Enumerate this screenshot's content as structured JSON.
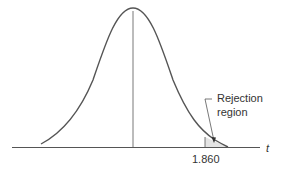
{
  "diagram": {
    "type": "t-distribution density curve",
    "axis_label": "t",
    "critical_value_label": "1.860",
    "annotation": {
      "line1": "Rejection",
      "line2": "region"
    },
    "colors": {
      "curve": "#555555",
      "axis": "#555555",
      "shade": "#e4e4e4"
    }
  }
}
